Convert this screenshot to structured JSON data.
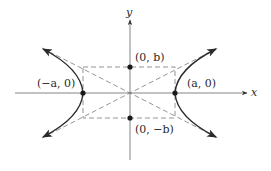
{
  "diagram": {
    "axes": {
      "x_label": "x",
      "y_label": "y"
    },
    "points": [
      {
        "id": "left-vertex",
        "label": "(−a, 0)",
        "px": 83,
        "py": 93
      },
      {
        "id": "right-vertex",
        "label": "(a, 0)",
        "px": 175,
        "py": 93
      },
      {
        "id": "top-co-vertex",
        "label": "(0, b)",
        "px": 130,
        "py": 67
      },
      {
        "id": "bottom-co-vertex",
        "label": "(0, −b)",
        "px": 130,
        "py": 118
      }
    ],
    "labels": {
      "left_vertex": "(−a, 0)",
      "right_vertex": "(a, 0)",
      "top_co_vertex": "(0, b)",
      "bottom_co_vertex": "(0, −b)"
    },
    "elements": {
      "central_rectangle": "dashed rectangle through (±a, ±b)",
      "asymptotes": "dashed lines y = ±(b/a)x",
      "branches": "two hyperbola branches opening left and right"
    },
    "colors": {
      "curve": "#2a2a2a",
      "axis": "#555555",
      "dashed": "#777777",
      "point": "#1a1a1a"
    }
  }
}
